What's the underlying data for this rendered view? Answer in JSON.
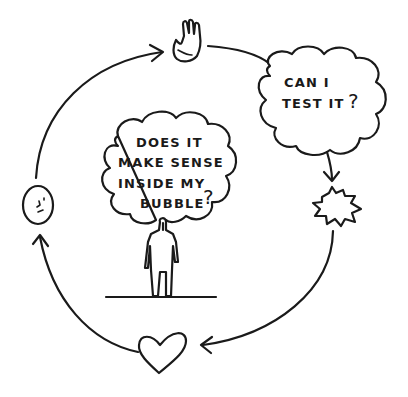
{
  "diagram": {
    "type": "cycle",
    "style": "hand-drawn sketch",
    "colors": {
      "ink": "#1a1a1a",
      "background": "#ffffff"
    },
    "center": {
      "thought_bubble": {
        "lines": [
          "DOES IT",
          "MAKE SENSE",
          "INSIDE MY",
          "BUBBLE"
        ],
        "question_mark": "?"
      },
      "figure": "standing-person-icon"
    },
    "cycle_nodes": [
      {
        "id": "raise-hand",
        "icon": "raised-hand-icon"
      },
      {
        "id": "test-question",
        "icon": "thought-cloud-icon",
        "lines": [
          "CAN I",
          "TEST IT"
        ],
        "question_mark": "?"
      },
      {
        "id": "burst",
        "icon": "starburst-icon"
      },
      {
        "id": "love",
        "icon": "heart-icon"
      },
      {
        "id": "thinking-face",
        "icon": "face-icon"
      }
    ],
    "arrows": [
      {
        "from": "thinking-face",
        "to": "raise-hand"
      },
      {
        "from": "raise-hand",
        "to": "test-question"
      },
      {
        "from": "test-question",
        "to": "burst"
      },
      {
        "from": "burst",
        "to": "love"
      },
      {
        "from": "love",
        "to": "thinking-face"
      }
    ]
  }
}
